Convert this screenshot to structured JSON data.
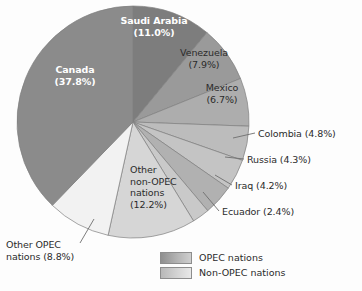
{
  "chart_data": {
    "type": "pie",
    "title": "",
    "units": "percent of total",
    "start_angle_deg": 0,
    "direction": "clockwise",
    "center": [
      133,
      122
    ],
    "radius": 116,
    "categories": [
      "Saudi Arabia",
      "Venezuela",
      "Mexico",
      "Colombia",
      "Russia",
      "Iraq",
      "Ecuador",
      "Other non-OPEC nations",
      "Other OPEC nations",
      "Canada"
    ],
    "values": [
      11.0,
      7.9,
      6.7,
      4.8,
      4.3,
      4.2,
      2.4,
      12.2,
      8.8,
      37.8
    ],
    "slices": [
      {
        "name": "Saudi Arabia",
        "label": "Saudi Arabia\n(11.0%)",
        "value": 11.0,
        "group": "OPEC nations",
        "color": "#7d7d7d",
        "label_style": "inner-white"
      },
      {
        "name": "Venezuela",
        "label": "Venezuela\n(7.9%)",
        "value": 7.9,
        "group": "OPEC nations",
        "color": "#9a9a9a",
        "label_style": "inner-dark"
      },
      {
        "name": "Mexico",
        "label": "Mexico\n(6.7%)",
        "value": 6.7,
        "group": "Non-OPEC nations",
        "color": "#adadad",
        "label_style": "inner-dark"
      },
      {
        "name": "Colombia",
        "label": "Colombia (4.8%)",
        "value": 4.8,
        "group": "Non-OPEC nations",
        "color": "#bcbcbc",
        "label_style": "callout"
      },
      {
        "name": "Russia",
        "label": "Russia (4.3%)",
        "value": 4.3,
        "group": "Non-OPEC nations",
        "color": "#c4c4c4",
        "label_style": "callout"
      },
      {
        "name": "Iraq",
        "label": "Iraq (4.2%)",
        "value": 4.2,
        "group": "OPEC nations",
        "color": "#b1b1b1",
        "label_style": "callout"
      },
      {
        "name": "Ecuador",
        "label": "Ecuador (2.4%)",
        "value": 2.4,
        "group": "OPEC nations",
        "color": "#c9c9c9",
        "label_style": "callout"
      },
      {
        "name": "Other non-OPEC nations",
        "label": "Other\nnon-OPEC\nnations\n(12.2%)",
        "value": 12.2,
        "group": "Non-OPEC nations",
        "color": "#d6d6d6",
        "label_style": "inner-dark"
      },
      {
        "name": "Other OPEC nations",
        "label": "Other OPEC\nnations (8.8%)",
        "value": 8.8,
        "group": "OPEC nations",
        "color": "#f2f2f2",
        "label_style": "callout"
      },
      {
        "name": "Canada",
        "label": "Canada\n(37.8%)",
        "value": 37.8,
        "group": "Non-OPEC nations",
        "color": "#8b8b8b",
        "label_style": "inner-white"
      }
    ],
    "legend": {
      "position": "bottom-center",
      "entries": [
        {
          "label": "OPEC nations",
          "swatch": "opec-gradient"
        },
        {
          "label": "Non-OPEC nations",
          "swatch": "non-opec-gradient"
        }
      ]
    },
    "grid": false,
    "xlabel": "",
    "ylabel": ""
  }
}
